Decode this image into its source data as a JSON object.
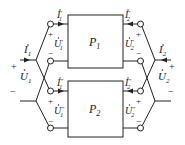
{
  "diagram": {
    "networks": [
      {
        "id": "P1",
        "label": "P",
        "sub": "1"
      },
      {
        "id": "P2",
        "label": "P",
        "sub": "2"
      }
    ],
    "port1": {
      "current": {
        "sym": "I",
        "sub": "1"
      },
      "voltage": {
        "sym": "U",
        "sub": "1"
      },
      "plus": "+",
      "minus": "−"
    },
    "port2": {
      "current": {
        "sym": "I",
        "sub": "2"
      },
      "voltage": {
        "sym": "U",
        "sub": "2"
      },
      "plus": "+",
      "minus": "−"
    },
    "sub_labels": {
      "I1p": {
        "sym": "I",
        "sub": "1",
        "sup": "′"
      },
      "U1p": {
        "sym": "U",
        "sub": "1",
        "sup": "′"
      },
      "I2p": {
        "sym": "I",
        "sub": "2",
        "sup": "′"
      },
      "U2p": {
        "sym": "U",
        "sub": "2",
        "sup": "′"
      },
      "I1pp": {
        "sym": "I",
        "sub": "1",
        "sup": "″"
      },
      "U1pp": {
        "sym": "U",
        "sub": "1",
        "sup": "″"
      },
      "I2pp": {
        "sym": "I",
        "sub": "2",
        "sup": "″"
      },
      "U2pp": {
        "sym": "U",
        "sub": "2",
        "sup": "″"
      }
    },
    "plus": "+",
    "minus": "−"
  }
}
